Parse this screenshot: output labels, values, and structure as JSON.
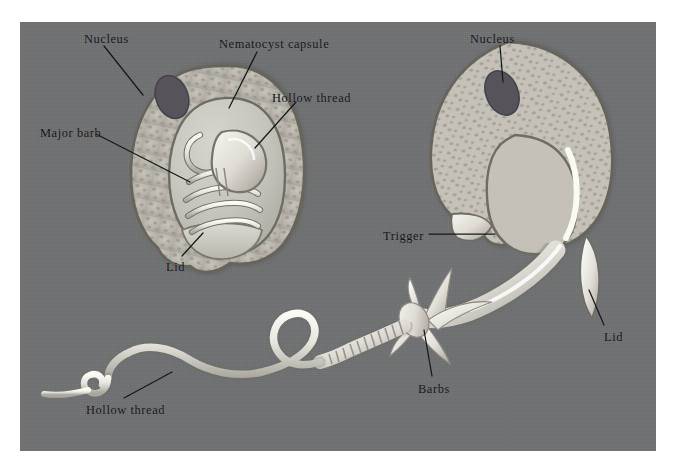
{
  "figure": {
    "plate_background": "#6f7173",
    "page_background": "#ffffff",
    "ink_color": "#14161a"
  },
  "palette": {
    "cell_cytoplasm": "#b9b7ad",
    "cell_membrane": "#6a675e",
    "capsule_fill": "#c9c8c0",
    "capsule_outline": "#73706a",
    "nucleus": "#59575a",
    "thread_highlight": "#f2f1ea",
    "thread_shadow": "#9d9b93",
    "lid_fill": "#cfcec6"
  },
  "labels": [
    {
      "id": "nucleus-left",
      "text": "Nucleus",
      "x": 84,
      "y": 33
    },
    {
      "id": "nematocyst-capsule",
      "text": "Nematocyst capsule",
      "x": 219,
      "y": 38
    },
    {
      "id": "hollow-thread-top",
      "text": "Hollow thread",
      "x": 272,
      "y": 92
    },
    {
      "id": "major-barb",
      "text": "Major barb",
      "x": 40,
      "y": 127
    },
    {
      "id": "lid-left",
      "text": "Lid",
      "x": 166,
      "y": 261
    },
    {
      "id": "nucleus-right",
      "text": "Nucleus",
      "x": 470,
      "y": 33
    },
    {
      "id": "trigger",
      "text": "Trigger",
      "x": 383,
      "y": 230
    },
    {
      "id": "lid-right",
      "text": "Lid",
      "x": 604,
      "y": 331
    },
    {
      "id": "barbs",
      "text": "Barbs",
      "x": 418,
      "y": 383
    },
    {
      "id": "hollow-thread-bottom",
      "text": "Hollow thread",
      "x": 86,
      "y": 404
    }
  ],
  "structures": {
    "left_cell": "Undischarged nematocyte: intact cell with nucleus, coiled hollow thread and inverted major barb inside the nematocyst capsule, closed lid (operculum)",
    "right_cell": "Discharged nematocyte: empty capsule, open lid, trigger (cnidocil), everted thread with barbs"
  }
}
